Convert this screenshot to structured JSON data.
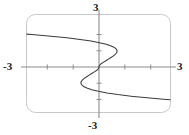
{
  "figure": {
    "name": "graph-figure",
    "background_color": "#ffffff",
    "frame": {
      "name": "plot-frame",
      "shape": "rounded-rectangle",
      "stroke_color": "#c9c9c9",
      "corner_radius": 9,
      "x": 26,
      "y": 14,
      "width": 145,
      "height": 99
    },
    "axis_color": "#8c8c8c",
    "curve_color": "#3b3b3b",
    "tick_color": "#8c8c8c"
  },
  "labels": {
    "top": "3",
    "bottom": "-3",
    "left": "-3",
    "right": "3"
  },
  "chart_data": {
    "type": "line",
    "title": "",
    "xlabel": "",
    "ylabel": "",
    "xlim": [
      -3,
      3
    ],
    "ylim": [
      -3,
      3
    ],
    "xticks": [
      -3,
      -2,
      -1,
      0,
      1,
      2,
      3
    ],
    "xtick_labels": [
      "-3",
      "",
      "",
      "",
      "",
      "",
      "3"
    ],
    "yticks": [
      -3,
      -2,
      -1,
      0,
      1,
      2,
      3
    ],
    "ytick_labels": [
      "-3",
      "",
      "",
      "",
      "",
      "",
      "3"
    ],
    "grid": false,
    "legend": false,
    "axes": "centered-origin",
    "series": [
      {
        "name": "x = y^5 - 2y^3 + y (sideways quintic)",
        "orientation": "x-as-function-of-y",
        "symmetry": "odd about origin",
        "note": "Curve drawn parametrically in y over [-2.05, 2.05]; x clipped to [-3, 3]",
        "points": [
          {
            "y": -2.05,
            "x": 3.0
          },
          {
            "y": -2.0,
            "x": 2.6
          },
          {
            "y": -1.9,
            "x": 1.86
          },
          {
            "y": -1.8,
            "x": 1.24
          },
          {
            "y": -1.7,
            "x": 0.73
          },
          {
            "y": -1.6,
            "x": 0.31
          },
          {
            "y": -1.5,
            "x": -0.02
          },
          {
            "y": -1.4,
            "x": -0.28
          },
          {
            "y": -1.3,
            "x": -0.47
          },
          {
            "y": -1.2,
            "x": -0.6
          },
          {
            "y": -1.1,
            "x": -0.67
          },
          {
            "y": -1.0,
            "x": -0.7
          },
          {
            "y": -0.9,
            "x": -0.69
          },
          {
            "y": -0.8,
            "x": -0.64
          },
          {
            "y": -0.7,
            "x": -0.57
          },
          {
            "y": -0.6,
            "x": -0.48
          },
          {
            "y": -0.5,
            "x": -0.38
          },
          {
            "y": -0.4,
            "x": -0.28
          },
          {
            "y": -0.3,
            "x": -0.18
          },
          {
            "y": -0.2,
            "x": -0.08
          },
          {
            "y": -0.1,
            "x": -0.02
          },
          {
            "y": 0.0,
            "x": 0.0
          },
          {
            "y": 0.1,
            "x": 0.02
          },
          {
            "y": 0.2,
            "x": 0.08
          },
          {
            "y": 0.3,
            "x": 0.18
          },
          {
            "y": 0.4,
            "x": 0.28
          },
          {
            "y": 0.5,
            "x": 0.38
          },
          {
            "y": 0.6,
            "x": 0.48
          },
          {
            "y": 0.7,
            "x": 0.57
          },
          {
            "y": 0.8,
            "x": 0.64
          },
          {
            "y": 0.9,
            "x": 0.69
          },
          {
            "y": 1.0,
            "x": 0.7
          },
          {
            "y": 1.1,
            "x": 0.67
          },
          {
            "y": 1.2,
            "x": 0.6
          },
          {
            "y": 1.3,
            "x": 0.47
          },
          {
            "y": 1.4,
            "x": 0.28
          },
          {
            "y": 1.5,
            "x": 0.02
          },
          {
            "y": 1.6,
            "x": -0.31
          },
          {
            "y": 1.7,
            "x": -0.73
          },
          {
            "y": 1.8,
            "x": -1.24
          },
          {
            "y": 1.9,
            "x": -1.86
          },
          {
            "y": 2.0,
            "x": -2.6
          },
          {
            "y": 2.05,
            "x": -3.0
          }
        ],
        "turning_points": [
          {
            "x": -2.25,
            "y": 1.2,
            "type": "leftmost-upper-lobe"
          },
          {
            "x": -2.25,
            "y": -1.2,
            "type": "leftmost-lower-lobe"
          }
        ],
        "origin_crossing": {
          "x": 0,
          "y": 0
        }
      }
    ]
  }
}
